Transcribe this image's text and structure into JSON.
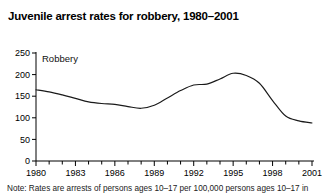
{
  "chart_data": {
    "type": "line",
    "title": "Juvenile arrest rates for robbery, 1980–2001",
    "xlabel": "",
    "ylabel": "",
    "xlim": [
      1980,
      2001
    ],
    "ylim": [
      0,
      250
    ],
    "grid": false,
    "legend_position": "inside-top-left",
    "series_name": "Robbery",
    "x": [
      1980,
      1981,
      1982,
      1983,
      1984,
      1985,
      1986,
      1987,
      1988,
      1989,
      1990,
      1991,
      1992,
      1993,
      1994,
      1995,
      1996,
      1997,
      1998,
      1999,
      2000,
      2001
    ],
    "values": [
      165,
      160,
      153,
      145,
      137,
      133,
      131,
      126,
      122,
      129,
      146,
      163,
      176,
      178,
      190,
      203,
      198,
      180,
      140,
      104,
      93,
      88
    ],
    "y_ticks": [
      0,
      50,
      100,
      150,
      200,
      250
    ],
    "x_ticks_labeled": [
      1980,
      1983,
      1986,
      1989,
      1992,
      1995,
      1998,
      2001
    ],
    "x_ticks_all": [
      1980,
      1981,
      1982,
      1983,
      1984,
      1985,
      1986,
      1987,
      1988,
      1989,
      1990,
      1991,
      1992,
      1993,
      1994,
      1995,
      1996,
      1997,
      1998,
      1999,
      2000,
      2001
    ],
    "line_color": "#1a1a1a",
    "annotations": [
      "Robbery"
    ]
  },
  "note": {
    "text": "Note: Rates are arrests of persons ages 10–17 per 100,000 persons ages 10–17 in"
  },
  "axis": {
    "y_tick_labels": [
      "0",
      "50",
      "100",
      "150",
      "200",
      "250"
    ],
    "x_tick_labels": [
      "1980",
      "1983",
      "1986",
      "1989",
      "1992",
      "1995",
      "1998",
      "2001"
    ]
  }
}
